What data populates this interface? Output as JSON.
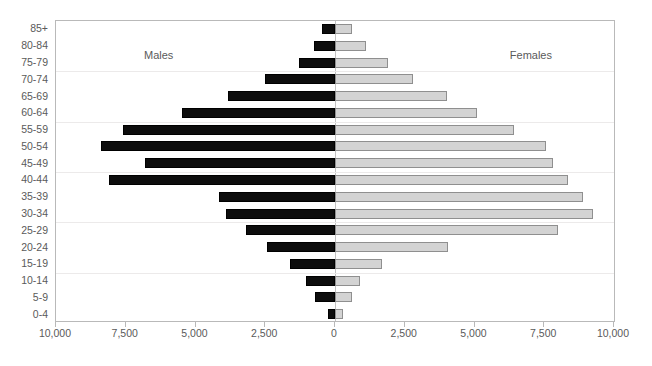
{
  "chart_data": {
    "type": "bar",
    "subtype": "population-pyramid",
    "title": "",
    "xlabel": "",
    "ylabel": "",
    "orientation": "horizontal",
    "grid": true,
    "legend_position": "inside-top",
    "categories": [
      "0-4",
      "5-9",
      "10-14",
      "15-19",
      "20-24",
      "25-29",
      "30-34",
      "35-39",
      "40-44",
      "45-49",
      "50-54",
      "55-59",
      "60-64",
      "65-69",
      "70-74",
      "75-79",
      "80-84",
      "85+"
    ],
    "categories_top_to_bottom": [
      "85+",
      "80-84",
      "75-79",
      "70-74",
      "65-69",
      "60-64",
      "55-59",
      "50-54",
      "45-49",
      "40-44",
      "35-39",
      "30-34",
      "25-29",
      "20-24",
      "15-19",
      "10-14",
      "5-9",
      "0-4"
    ],
    "xlim": [
      -10000,
      10000
    ],
    "xticks": [
      -10000,
      -7500,
      -5000,
      -2500,
      0,
      2500,
      5000,
      7500,
      10000
    ],
    "xtick_labels": [
      "10,000",
      "7,500",
      "5,000",
      "2,500",
      "0",
      "2,500",
      "5,000",
      "7,500",
      "10,000"
    ],
    "series": [
      {
        "name": "Males",
        "side": "left",
        "color": "#0d0d0d",
        "values_top_to_bottom": [
          450,
          750,
          1300,
          2500,
          3850,
          5500,
          7600,
          8400,
          6800,
          8100,
          4150,
          3900,
          3200,
          2450,
          1600,
          1050,
          700,
          250
        ]
      },
      {
        "name": "Females",
        "side": "right",
        "color": "#d3d3d3",
        "values_top_to_bottom": [
          600,
          1100,
          1900,
          2800,
          4000,
          5100,
          6400,
          7550,
          7800,
          8350,
          8900,
          9250,
          8000,
          4050,
          1700,
          900,
          600,
          300
        ]
      }
    ]
  },
  "labels": {
    "males": "Males",
    "females": "Females"
  }
}
